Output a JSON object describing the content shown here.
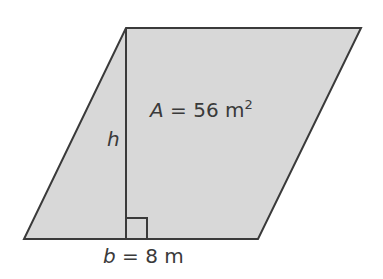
{
  "figure": {
    "shape": "parallelogram",
    "fill_color": "#d8d8d8",
    "stroke_color": "#3a3a3a",
    "area_label": {
      "var": "A",
      "eq": " = 56 m",
      "sup": "2"
    },
    "height_label": "h",
    "base_label": {
      "var": "b",
      "eq": " = 8 m"
    }
  }
}
